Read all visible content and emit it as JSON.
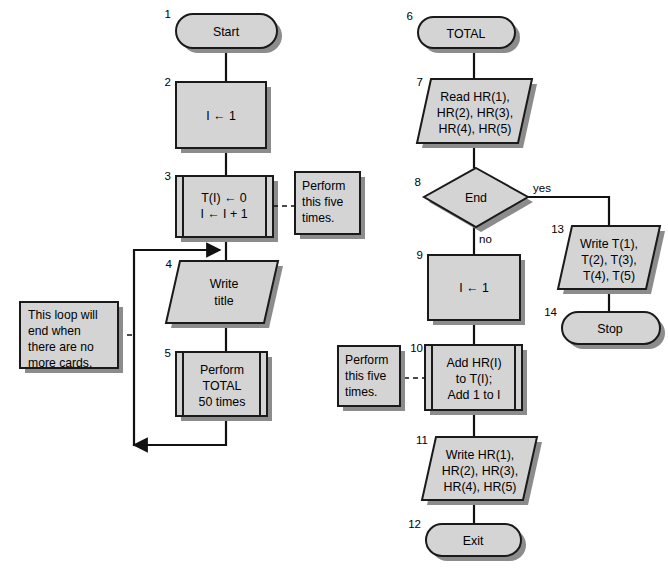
{
  "diagram": {
    "colors": {
      "shape_fill": "#d4d4d4",
      "shape_stroke": "#1a1a1a",
      "shadow": "#8c8c8c",
      "connector": "#111111",
      "background": "#ffffff"
    },
    "nodes": [
      {
        "id": "n1",
        "number": "1",
        "shape": "terminator",
        "lines": [
          "Start"
        ]
      },
      {
        "id": "n2",
        "number": "2",
        "shape": "process",
        "lines": [
          "I ← 1"
        ]
      },
      {
        "id": "n3",
        "number": "3",
        "shape": "predefined-process",
        "lines": [
          "T(I) ← 0",
          "I ← I + 1"
        ]
      },
      {
        "id": "n4",
        "number": "4",
        "shape": "input-output",
        "lines": [
          "Write",
          "title"
        ]
      },
      {
        "id": "n5",
        "number": "5",
        "shape": "predefined-process",
        "lines": [
          "Perform",
          "TOTAL",
          "50 times"
        ]
      },
      {
        "id": "n6",
        "number": "6",
        "shape": "terminator",
        "lines": [
          "TOTAL"
        ]
      },
      {
        "id": "n7",
        "number": "7",
        "shape": "input-output",
        "lines": [
          "Read HR(1),",
          "HR(2), HR(3),",
          "HR(4), HR(5)"
        ]
      },
      {
        "id": "n8",
        "number": "8",
        "shape": "decision",
        "lines": [
          "End"
        ]
      },
      {
        "id": "n9",
        "number": "9",
        "shape": "process",
        "lines": [
          "I ← 1"
        ]
      },
      {
        "id": "n10",
        "number": "10",
        "shape": "predefined-process",
        "lines": [
          "Add HR(I)",
          "to T(I);",
          "Add 1 to I"
        ]
      },
      {
        "id": "n11",
        "number": "11",
        "shape": "input-output",
        "lines": [
          "Write HR(1),",
          "HR(2), HR(3),",
          "HR(4), HR(5)"
        ]
      },
      {
        "id": "n12",
        "number": "12",
        "shape": "terminator",
        "lines": [
          "Exit"
        ]
      },
      {
        "id": "n13",
        "number": "13",
        "shape": "input-output",
        "lines": [
          "Write T(1),",
          "T(2), T(3),",
          "T(4), T(5)"
        ]
      },
      {
        "id": "n14",
        "number": "14",
        "shape": "terminator",
        "lines": [
          "Stop"
        ]
      }
    ],
    "annotations": [
      {
        "id": "a1",
        "attached_to": "n3",
        "lines": [
          "Perform",
          "this five",
          "times."
        ]
      },
      {
        "id": "a2",
        "attached_to": "loop",
        "lines": [
          "This loop will",
          "end when",
          "there are no",
          "more cards."
        ]
      },
      {
        "id": "a3",
        "attached_to": "n10",
        "lines": [
          "Perform",
          "this five",
          "times."
        ]
      }
    ],
    "branch_labels": {
      "yes": "yes",
      "no": "no"
    }
  }
}
